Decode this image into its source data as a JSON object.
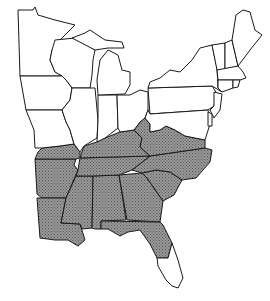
{
  "map": {
    "title": "",
    "region": "Eastern United States",
    "colors": {
      "background": "#ffffff",
      "outline": "#1a1a1a",
      "shaded_fill": "#8a8a8a",
      "unshaded_fill": "#ffffff"
    },
    "shaded_states": [
      "Arkansas",
      "Louisiana",
      "Mississippi",
      "Alabama",
      "Georgia",
      "South Carolina",
      "North Carolina",
      "Tennessee",
      "Kentucky",
      "Virginia (southern)",
      "West Virginia (part)",
      "Florida (northern)",
      "Missouri (bootheel)",
      "Illinois (southern tip)"
    ],
    "unshaded_states": [
      "Minnesota",
      "Wisconsin",
      "Iowa",
      "Illinois",
      "Missouri",
      "Michigan",
      "Indiana",
      "Ohio",
      "Pennsylvania",
      "New York",
      "Vermont",
      "New Hampshire",
      "Maine",
      "Massachusetts",
      "Connecticut",
      "Rhode Island",
      "New Jersey",
      "Delaware",
      "Maryland",
      "Florida (southern)"
    ]
  }
}
